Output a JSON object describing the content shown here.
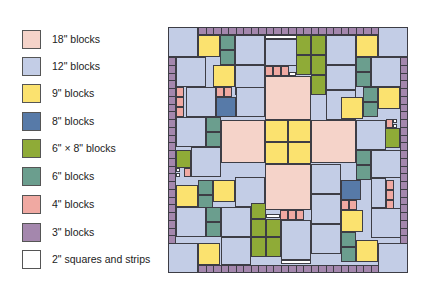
{
  "legend": {
    "items": [
      {
        "label": "18\" blocks",
        "color": "#f5d3c9",
        "key": "b18"
      },
      {
        "label": "12\" blocks",
        "color": "#c3cde6",
        "key": "b12"
      },
      {
        "label": "9\" blocks",
        "color": "#fbe26f",
        "key": "b9"
      },
      {
        "label": "8\" blocks",
        "color": "#577aa8",
        "key": "b8"
      },
      {
        "label": "6\" × 8\" blocks",
        "color": "#8fab37",
        "key": "b6x8"
      },
      {
        "label": "6\" blocks",
        "color": "#6b9e8e",
        "key": "b6"
      },
      {
        "label": "4\" blocks",
        "color": "#f0a9a2",
        "key": "b4"
      },
      {
        "label": "3\" blocks",
        "color": "#a487ad",
        "key": "b3"
      },
      {
        "label": "2\" squares and strips",
        "color": "#ffffff",
        "key": "b2"
      }
    ]
  },
  "quilt": {
    "bounds": {
      "x": 168,
      "y": 27,
      "w": 240,
      "h": 246
    },
    "colors": {
      "b18": "#f5d3c9",
      "b12": "#c3cde6",
      "b9": "#fbe26f",
      "b8": "#577aa8",
      "b6x8": "#8fab37",
      "b6": "#6b9e8e",
      "b4": "#f0a9a2",
      "b3": "#a487ad",
      "b2": "#ffffff"
    },
    "blocks": [
      [
        "b12",
        168,
        27,
        30,
        30
      ],
      [
        "b9",
        198,
        35,
        22,
        22
      ],
      [
        "b6",
        220,
        35,
        15,
        15
      ],
      [
        "b6",
        220,
        50,
        15,
        15
      ],
      [
        "b12",
        235,
        35,
        30,
        30
      ],
      [
        "b2",
        265,
        35,
        37,
        4
      ],
      [
        "b12",
        265,
        39,
        37,
        27
      ],
      [
        "b6x8",
        296,
        35,
        15,
        20
      ],
      [
        "b6x8",
        311,
        35,
        15,
        20
      ],
      [
        "b6x8",
        296,
        55,
        15,
        20
      ],
      [
        "b6x8",
        311,
        55,
        15,
        20
      ],
      [
        "b6x8",
        311,
        75,
        15,
        20
      ],
      [
        "b12",
        326,
        35,
        30,
        30
      ],
      [
        "b9",
        356,
        35,
        22,
        22
      ],
      [
        "b12",
        378,
        27,
        30,
        30
      ],
      [
        "b12",
        176,
        57,
        30,
        30
      ],
      [
        "b9",
        213,
        65,
        22,
        22
      ],
      [
        "b12",
        235,
        65,
        30,
        30
      ],
      [
        "b4",
        265,
        66,
        8,
        10
      ],
      [
        "b4",
        273,
        66,
        8,
        10
      ],
      [
        "b4",
        281,
        66,
        8,
        10
      ],
      [
        "b2",
        289,
        72,
        7,
        4
      ],
      [
        "b12",
        326,
        65,
        30,
        25
      ],
      [
        "b6",
        356,
        57,
        15,
        15
      ],
      [
        "b6",
        356,
        72,
        15,
        15
      ],
      [
        "b12",
        371,
        57,
        30,
        30
      ],
      [
        "b4",
        176,
        87,
        8,
        10
      ],
      [
        "b4",
        176,
        97,
        8,
        10
      ],
      [
        "b4",
        176,
        107,
        8,
        10
      ],
      [
        "b12",
        186,
        87,
        30,
        30
      ],
      [
        "b4",
        216,
        87,
        8,
        10
      ],
      [
        "b4",
        224,
        87,
        8,
        10
      ],
      [
        "b8",
        216,
        97,
        20,
        20
      ],
      [
        "b12",
        236,
        87,
        29,
        30
      ],
      [
        "b18",
        265,
        76,
        46,
        44
      ],
      [
        "b12",
        326,
        90,
        30,
        30
      ],
      [
        "b9",
        341,
        97,
        22,
        22
      ],
      [
        "b6",
        363,
        87,
        15,
        15
      ],
      [
        "b6",
        363,
        102,
        15,
        15
      ],
      [
        "b9",
        378,
        87,
        22,
        22
      ],
      [
        "b12",
        176,
        117,
        30,
        30
      ],
      [
        "b6",
        206,
        117,
        15,
        15
      ],
      [
        "b6",
        206,
        132,
        15,
        15
      ],
      [
        "b18",
        221,
        120,
        44,
        43
      ],
      [
        "b9",
        265,
        120,
        23,
        22
      ],
      [
        "b9",
        288,
        120,
        23,
        22
      ],
      [
        "b9",
        265,
        142,
        23,
        22
      ],
      [
        "b9",
        288,
        142,
        23,
        22
      ],
      [
        "b18",
        311,
        120,
        45,
        43
      ],
      [
        "b12",
        356,
        120,
        30,
        30
      ],
      [
        "b4",
        386,
        119,
        7,
        9
      ],
      [
        "b2",
        393,
        119,
        4,
        4
      ],
      [
        "b2",
        393,
        124,
        4,
        4
      ],
      [
        "b6x8",
        385,
        128,
        15,
        20
      ],
      [
        "b6x8",
        176,
        150,
        15,
        18
      ],
      [
        "b12",
        191,
        147,
        30,
        30
      ],
      [
        "b4",
        184,
        168,
        7,
        9
      ],
      [
        "b2",
        176,
        168,
        4,
        4
      ],
      [
        "b2",
        176,
        173,
        4,
        4
      ],
      [
        "b18",
        265,
        164,
        46,
        46
      ],
      [
        "b6",
        356,
        150,
        15,
        15
      ],
      [
        "b6",
        356,
        165,
        15,
        15
      ],
      [
        "b12",
        371,
        150,
        30,
        28
      ],
      [
        "b9",
        176,
        185,
        22,
        22
      ],
      [
        "b6",
        198,
        180,
        15,
        15
      ],
      [
        "b6",
        198,
        195,
        15,
        15
      ],
      [
        "b9",
        213,
        180,
        22,
        22
      ],
      [
        "b12",
        235,
        177,
        30,
        30
      ],
      [
        "b12",
        311,
        164,
        30,
        30
      ],
      [
        "b8",
        341,
        180,
        20,
        20
      ],
      [
        "b4",
        341,
        200,
        8,
        10
      ],
      [
        "b4",
        349,
        200,
        8,
        10
      ],
      [
        "b4",
        386,
        180,
        8,
        10
      ],
      [
        "b4",
        386,
        190,
        8,
        10
      ],
      [
        "b4",
        386,
        200,
        8,
        10
      ],
      [
        "b12",
        371,
        178,
        15,
        30
      ],
      [
        "b12",
        176,
        207,
        30,
        30
      ],
      [
        "b6",
        206,
        207,
        15,
        15
      ],
      [
        "b6",
        206,
        222,
        15,
        15
      ],
      [
        "b12",
        221,
        207,
        30,
        30
      ],
      [
        "b6x8",
        251,
        203,
        15,
        16
      ],
      [
        "b6x8",
        251,
        219,
        15,
        18
      ],
      [
        "b6x8",
        266,
        219,
        15,
        18
      ],
      [
        "b2",
        266,
        214,
        14,
        4
      ],
      [
        "b4",
        280,
        210,
        8,
        10
      ],
      [
        "b4",
        288,
        210,
        8,
        10
      ],
      [
        "b4",
        296,
        210,
        8,
        10
      ],
      [
        "b12",
        311,
        194,
        30,
        30
      ],
      [
        "b12",
        311,
        224,
        30,
        30
      ],
      [
        "b9",
        341,
        210,
        22,
        22
      ],
      [
        "b12",
        371,
        208,
        30,
        30
      ],
      [
        "b6",
        341,
        232,
        15,
        15
      ],
      [
        "b6",
        341,
        247,
        15,
        15
      ],
      [
        "b9",
        356,
        240,
        22,
        22
      ],
      [
        "b12",
        168,
        243,
        30,
        30
      ],
      [
        "b9",
        198,
        243,
        22,
        22
      ],
      [
        "b12",
        221,
        237,
        30,
        28
      ],
      [
        "b6x8",
        251,
        237,
        15,
        20
      ],
      [
        "b6x8",
        266,
        237,
        15,
        20
      ],
      [
        "b12",
        281,
        220,
        30,
        40
      ],
      [
        "b2",
        281,
        260,
        30,
        4
      ],
      [
        "b12",
        378,
        243,
        30,
        30
      ]
    ],
    "borders": {
      "top": {
        "x": 198,
        "y": 27,
        "w": 180,
        "h": 8,
        "count": 24
      },
      "bottom": {
        "x": 198,
        "y": 265,
        "w": 180,
        "h": 8,
        "count": 24
      },
      "left": {
        "x": 168,
        "y": 57,
        "w": 8,
        "h": 186,
        "count": 24
      },
      "right": {
        "x": 400,
        "y": 57,
        "w": 8,
        "h": 186,
        "count": 24
      }
    }
  }
}
